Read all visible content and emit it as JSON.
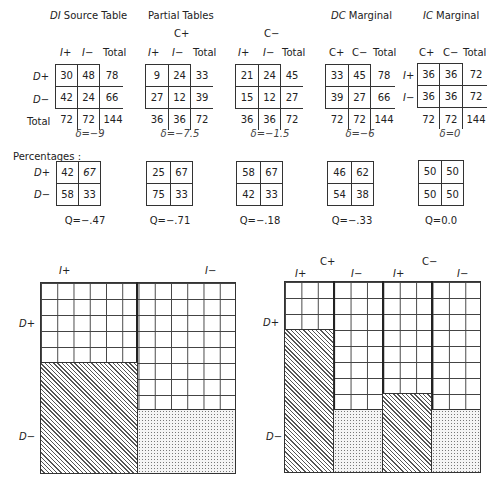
{
  "titles": {
    "source": "DI Source Table",
    "partial": "Partial Tables",
    "dc": "DC Marginal",
    "ic": "IC Marginal",
    "c_plus": "C+",
    "c_minus": "C−"
  },
  "labels": {
    "i_plus": "I+",
    "i_minus": "I−",
    "c_plus": "C+",
    "c_minus": "C−",
    "d_plus": "D+",
    "d_minus": "D−",
    "total": "Total",
    "percentages": "Percentages :"
  },
  "tables": [
    {
      "id": "source",
      "cells": [
        [
          "30",
          "48",
          "78"
        ],
        [
          "42",
          "24",
          "66"
        ],
        [
          "72",
          "72",
          "144"
        ]
      ],
      "delta": "δ=−9"
    },
    {
      "id": "c_plus",
      "cells": [
        [
          "9",
          "24",
          "33"
        ],
        [
          "27",
          "12",
          "39"
        ],
        [
          "36",
          "36",
          "72"
        ]
      ],
      "delta": "δ=−7.5"
    },
    {
      "id": "c_minus",
      "cells": [
        [
          "21",
          "24",
          "45"
        ],
        [
          "15",
          "12",
          "27"
        ],
        [
          "36",
          "36",
          "72"
        ]
      ],
      "delta": "δ=−1.5"
    },
    {
      "id": "dc",
      "cells": [
        [
          "33",
          "45",
          "78"
        ],
        [
          "39",
          "27",
          "66"
        ],
        [
          "72",
          "72",
          "144"
        ]
      ],
      "delta": "δ=−6"
    },
    {
      "id": "ic",
      "cells": [
        [
          "36",
          "36",
          "72"
        ],
        [
          "36",
          "36",
          "72"
        ],
        [
          "72",
          "72",
          "144"
        ]
      ],
      "delta": "δ=0"
    }
  ],
  "percent_tables": [
    {
      "cells": [
        [
          "42",
          "67"
        ],
        [
          "58",
          "33"
        ]
      ],
      "q": "Q=−.47"
    },
    {
      "cells": [
        [
          "25",
          "67"
        ],
        [
          "75",
          "33"
        ]
      ],
      "q": "Q=−.71"
    },
    {
      "cells": [
        [
          "58",
          "67"
        ],
        [
          "42",
          "33"
        ]
      ],
      "q": "Q=−.18"
    },
    {
      "cells": [
        [
          "46",
          "62"
        ],
        [
          "54",
          "38"
        ]
      ],
      "q": "Q=−.33"
    },
    {
      "cells": [
        [
          "50",
          "50"
        ],
        [
          "50",
          "50"
        ]
      ],
      "q": "Q=0.0"
    }
  ],
  "diagrams": {
    "left": {
      "columns": [
        "I+",
        "I−"
      ],
      "rows": [
        "D+",
        "D−"
      ],
      "d_minus_pct": [
        58,
        33
      ]
    },
    "right": {
      "groups": [
        "C+",
        "C−"
      ],
      "columns": [
        "I+",
        "I−",
        "I+",
        "I−"
      ],
      "rows": [
        "D+",
        "D−"
      ],
      "d_minus_pct": [
        75,
        33,
        42,
        33
      ]
    }
  }
}
